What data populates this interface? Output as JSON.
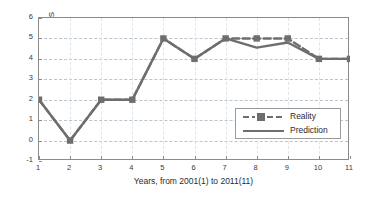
{
  "chart_data": {
    "type": "line",
    "title": "",
    "xlabel": "Years, from 2001(1) to 2011(11)",
    "ylabel": "Number of landfall TS",
    "x": [
      1,
      2,
      3,
      4,
      5,
      6,
      7,
      8,
      9,
      10,
      11
    ],
    "xticklabels": [
      "1",
      "2",
      "3",
      "4",
      "5",
      "6",
      "7",
      "8",
      "9",
      "10",
      "11"
    ],
    "yticklabels": [
      "-1",
      "0",
      "1",
      "2",
      "3",
      "4",
      "5",
      "6"
    ],
    "yticks": [
      -1,
      0,
      1,
      2,
      3,
      4,
      5,
      6
    ],
    "xlim": [
      1,
      11
    ],
    "ylim": [
      -1,
      6
    ],
    "grid": true,
    "legend_position": "center-right",
    "series": [
      {
        "name": "Reality",
        "style": "dashed",
        "marker": "square",
        "color": "#6e6e6e",
        "values": [
          2,
          0,
          2,
          2,
          5,
          4,
          5,
          5,
          5,
          4,
          4
        ]
      },
      {
        "name": "Prediction",
        "style": "solid",
        "marker": "none",
        "color": "#6e6e6e",
        "values": [
          2,
          0,
          2,
          2,
          5,
          4,
          5,
          4.55,
          4.8,
          4,
          4
        ]
      }
    ]
  },
  "legend": {
    "items": [
      {
        "label": "Reality"
      },
      {
        "label": "Prediction"
      }
    ]
  },
  "colors": {
    "line": "#6e6e6e",
    "axis": "#8a8a8a",
    "grid": "#b9c4cf",
    "text": "#2b2b2b",
    "background": "#ffffff"
  }
}
